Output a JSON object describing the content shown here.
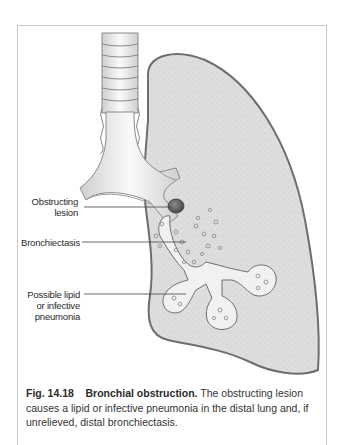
{
  "figure": {
    "labels": {
      "obstructing_lesion": [
        "Obstructing",
        "lesion"
      ],
      "bronchiectasis": "Bronchiectasis",
      "pneumonia": [
        "Possible lipid",
        "or infective",
        "pneumonia"
      ]
    },
    "caption": {
      "number": "Fig. 14.18",
      "title": "Bronchial obstruction.",
      "text": "The obstructing lesion causes a lipid or infective pneumonia in the distal lung and, if unrelieved, distal bronchiectasis."
    },
    "colors": {
      "lung_fill": "#dcdcdc",
      "lung_outline": "#6e6e6e",
      "airway_fill": "#f2f2f2",
      "lesion": "#6a6a6a",
      "frame": "#c8c8c8"
    }
  }
}
